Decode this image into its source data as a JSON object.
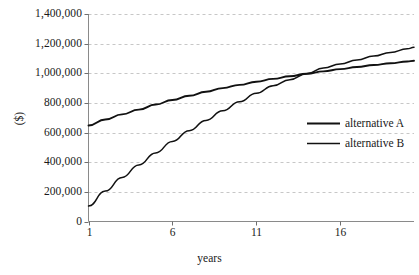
{
  "chart_data": {
    "type": "line",
    "title": "",
    "xlabel": "years",
    "ylabel": "($)",
    "xlim": [
      1,
      20.4
    ],
    "ylim": [
      0,
      1400000
    ],
    "grid": true,
    "grid_axis": "y",
    "legend_position": "center-right",
    "xticks": [
      1,
      6,
      11,
      16
    ],
    "xtick_labels": [
      "1",
      "6",
      "11",
      "16"
    ],
    "yticks": [
      0,
      200000,
      400000,
      600000,
      800000,
      1000000,
      1200000,
      1400000
    ],
    "ytick_labels": [
      "0",
      "200,000",
      "400,000",
      "600,000",
      "800,000",
      "1,000,000",
      "1,200,000",
      "1,400,000"
    ],
    "x": [
      1,
      2,
      3,
      4,
      5,
      6,
      7,
      8,
      9,
      10,
      11,
      12,
      13,
      14,
      15,
      16,
      17,
      18,
      19,
      20,
      20.4
    ],
    "series": [
      {
        "name": "alternative A",
        "color": "#111111",
        "values": [
          648000,
          688000,
          723000,
          755000,
          789000,
          820000,
          848000,
          875000,
          900000,
          922000,
          943000,
          962000,
          980000,
          997000,
          1013000,
          1028000,
          1042000,
          1056000,
          1068000,
          1080000,
          1085000
        ]
      },
      {
        "name": "alternative B",
        "color": "#111111",
        "values": [
          105000,
          205000,
          297000,
          382000,
          463000,
          540000,
          613000,
          682000,
          747000,
          808000,
          866000,
          916000,
          957000,
          997000,
          1036000,
          1063000,
          1090000,
          1116000,
          1140000,
          1165000,
          1175000
        ]
      }
    ]
  },
  "legend": {
    "entries": [
      {
        "label": "alternative A"
      },
      {
        "label": "alternative B"
      }
    ]
  }
}
